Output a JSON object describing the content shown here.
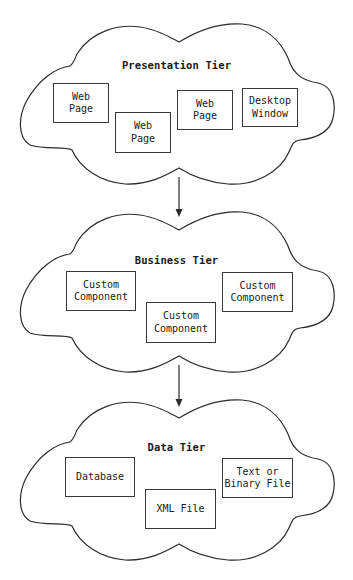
{
  "diagram": {
    "type": "three-tier architecture",
    "tiers": [
      {
        "title": "Presentation Tier",
        "components": [
          {
            "label": "Web\nPage"
          },
          {
            "label": "Web\nPage"
          },
          {
            "label": "Web\nPage"
          },
          {
            "label": "Desktop\nWindow"
          }
        ]
      },
      {
        "title": "Business Tier",
        "components": [
          {
            "label": "Custom\nComponent"
          },
          {
            "label": "Custom\nComponent"
          },
          {
            "label": "Custom\nComponent"
          }
        ]
      },
      {
        "title": "Data Tier",
        "components": [
          {
            "label": "Database"
          },
          {
            "label": "XML File"
          },
          {
            "label": "Text or\nBinary File"
          }
        ]
      }
    ],
    "connections": [
      {
        "from": "Presentation Tier",
        "to": "Business Tier",
        "style": "arrow"
      },
      {
        "from": "Business Tier",
        "to": "Data Tier",
        "style": "arrow"
      }
    ],
    "colors": {
      "line": "#2b2b2b",
      "background": "#ffffff"
    }
  }
}
